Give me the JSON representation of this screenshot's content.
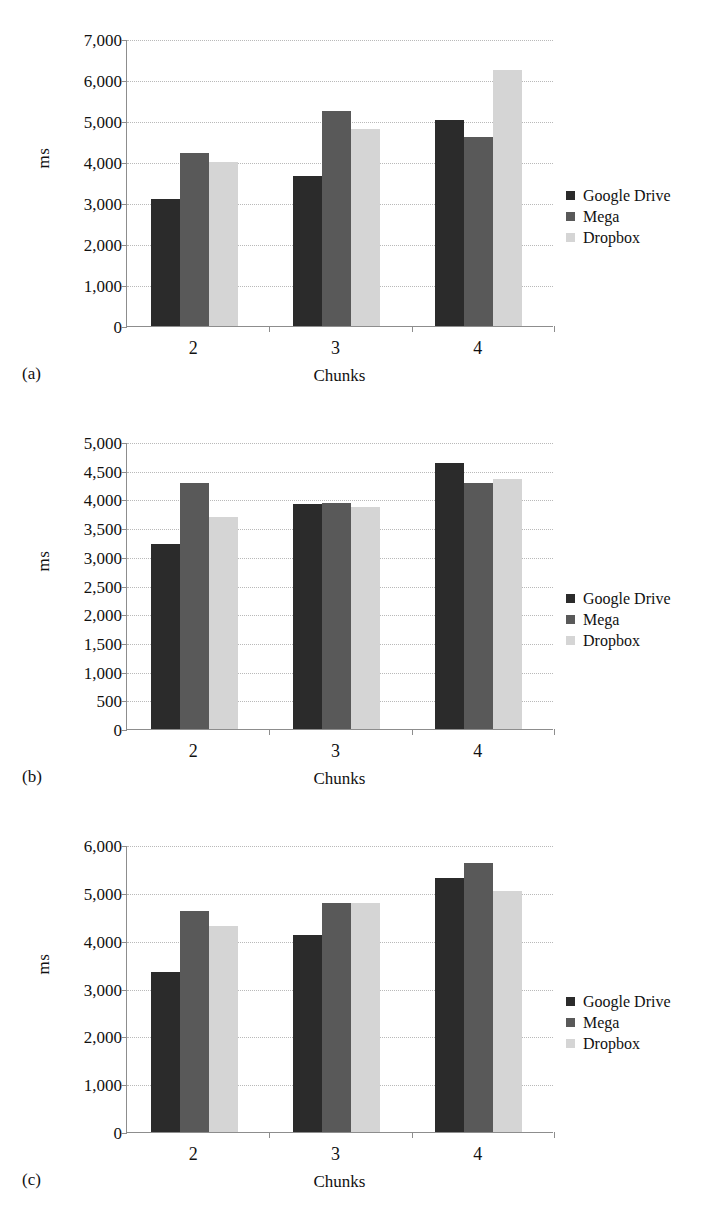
{
  "figure": {
    "series_colors": {
      "google_drive": "#2b2b2b",
      "mega": "#595959",
      "dropbox": "#d5d5d5"
    },
    "grid_color": "#b9b9b9",
    "axis_color": "#8d8d8d"
  },
  "panels": [
    {
      "caption": "(a)",
      "legend": [
        {
          "label": "Google Drive"
        },
        {
          "label": "Mega"
        },
        {
          "label": "Dropbox"
        }
      ],
      "chart_data": {
        "type": "bar",
        "title": "",
        "xlabel": "Chunks",
        "ylabel": "ms",
        "categories": [
          "2",
          "3",
          "4"
        ],
        "series": [
          {
            "name": "Google Drive",
            "values": [
              3110,
              3670,
              5020
            ]
          },
          {
            "name": "Mega",
            "values": [
              4210,
              5240,
              4600
            ]
          },
          {
            "name": "Dropbox",
            "values": [
              4010,
              4800,
              6250
            ]
          }
        ],
        "ylim": [
          0,
          7000
        ],
        "ytick_step": 1000,
        "yticks": [
          "0",
          "1,000",
          "2,000",
          "3,000",
          "4,000",
          "5,000",
          "6,000",
          "7,000"
        ],
        "grid": true,
        "legend_position": "right"
      }
    },
    {
      "caption": "(b)",
      "legend": [
        {
          "label": "Google Drive"
        },
        {
          "label": "Mega"
        },
        {
          "label": "Dropbox"
        }
      ],
      "chart_data": {
        "type": "bar",
        "title": "",
        "xlabel": "Chunks",
        "ylabel": "ms",
        "categories": [
          "2",
          "3",
          "4"
        ],
        "series": [
          {
            "name": "Google Drive",
            "values": [
              3220,
              3920,
              4630
            ]
          },
          {
            "name": "Mega",
            "values": [
              4280,
              3940,
              4290
            ]
          },
          {
            "name": "Dropbox",
            "values": [
              3690,
              3870,
              4350
            ]
          }
        ],
        "ylim": [
          0,
          5000
        ],
        "ytick_step": 500,
        "yticks": [
          "0",
          "500",
          "1,000",
          "1,500",
          "2,000",
          "2,500",
          "3,000",
          "3,500",
          "4,000",
          "4,500",
          "5,000"
        ],
        "grid": true,
        "legend_position": "right"
      }
    },
    {
      "caption": "(c)",
      "legend": [
        {
          "label": "Google Drive"
        },
        {
          "label": "Mega"
        },
        {
          "label": "Dropbox"
        }
      ],
      "chart_data": {
        "type": "bar",
        "title": "",
        "xlabel": "Chunks",
        "ylabel": "ms",
        "categories": [
          "2",
          "3",
          "4"
        ],
        "series": [
          {
            "name": "Google Drive",
            "values": [
              3350,
              4120,
              5300
            ]
          },
          {
            "name": "Mega",
            "values": [
              4620,
              4780,
              5630
            ]
          },
          {
            "name": "Dropbox",
            "values": [
              4300,
              4780,
              5040
            ]
          }
        ],
        "ylim": [
          0,
          6000
        ],
        "ytick_step": 1000,
        "yticks": [
          "0",
          "1,000",
          "2,000",
          "3,000",
          "4,000",
          "5,000",
          "6,000"
        ],
        "grid": true,
        "legend_position": "right"
      }
    }
  ]
}
